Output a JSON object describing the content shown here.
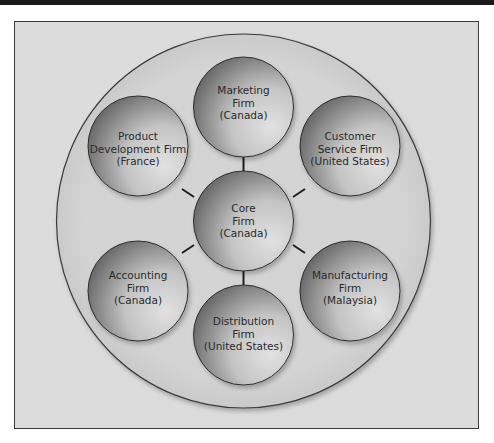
{
  "diagram": {
    "type": "hub-and-spoke network organization",
    "colors": {
      "frame_bg": "#dcdcdc",
      "outer_circle_bg": "#d2d2d2",
      "node_dark": "#5e5e5e",
      "node_light": "#dedede",
      "connector": "#1e1e1e",
      "text": "#2a2a2a"
    },
    "core": {
      "lines": [
        "Core",
        "Firm",
        "(Canada)"
      ]
    },
    "nodes": [
      {
        "id": "marketing",
        "lines": [
          "Marketing",
          "Firm",
          "(Canada)"
        ]
      },
      {
        "id": "customer-service",
        "lines": [
          "Customer",
          "Service Firm",
          "(United States)"
        ]
      },
      {
        "id": "manufacturing",
        "lines": [
          "Manufacturing",
          "Firm",
          "(Malaysia)"
        ]
      },
      {
        "id": "distribution",
        "lines": [
          "Distribution",
          "Firm",
          "(United States)"
        ]
      },
      {
        "id": "accounting",
        "lines": [
          "Accounting",
          "Firm",
          "(Canada)"
        ]
      },
      {
        "id": "product-development",
        "lines": [
          "Product",
          "Development Firm",
          "(France)"
        ]
      }
    ]
  }
}
